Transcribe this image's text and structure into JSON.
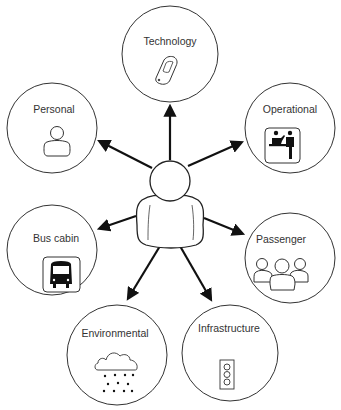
{
  "diagram": {
    "center": {
      "label": "",
      "icon": "person-icon"
    },
    "nodes": [
      {
        "id": "technology",
        "label": "Technology",
        "icon": "mobile-phone-icon"
      },
      {
        "id": "personal",
        "label": "Personal",
        "icon": "person-icon"
      },
      {
        "id": "operational",
        "label": "Operational",
        "icon": "ticket-counter-icon"
      },
      {
        "id": "bus-cabin",
        "label": "Bus cabin",
        "icon": "bus-icon"
      },
      {
        "id": "passenger",
        "label": "Passenger",
        "icon": "group-icon"
      },
      {
        "id": "environmental",
        "label": "Environmental",
        "icon": "rain-cloud-icon"
      },
      {
        "id": "infrastructure",
        "label": "Infrastructure",
        "icon": "traffic-light-icon"
      }
    ],
    "edges": [
      {
        "from": "center",
        "to": "technology"
      },
      {
        "from": "center",
        "to": "personal"
      },
      {
        "from": "center",
        "to": "operational"
      },
      {
        "from": "center",
        "to": "bus-cabin"
      },
      {
        "from": "center",
        "to": "passenger"
      },
      {
        "from": "center",
        "to": "environmental"
      },
      {
        "from": "center",
        "to": "infrastructure"
      }
    ]
  }
}
